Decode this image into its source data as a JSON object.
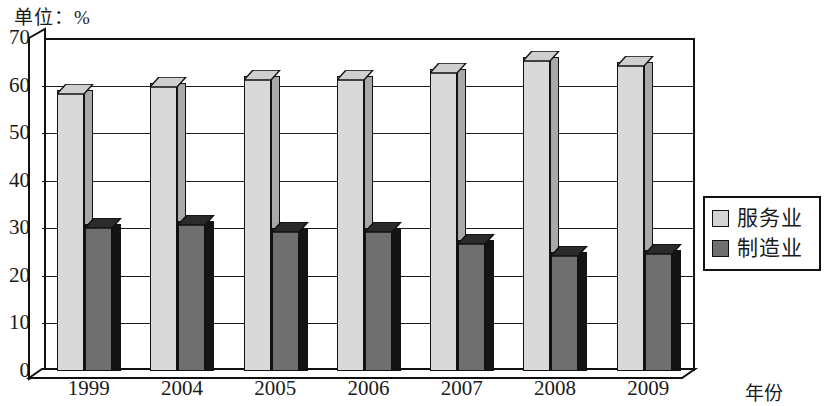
{
  "unit_label": "单位：%",
  "legend": {
    "items": [
      {
        "label": "服务业",
        "color": "#d4d4d4",
        "icon": "legend-swatch-light"
      },
      {
        "label": "制造业",
        "color": "#707070",
        "icon": "legend-swatch-dark"
      }
    ]
  },
  "axis": {
    "x_title": "年份",
    "y_ticks": [
      "0",
      "10",
      "20",
      "30",
      "40",
      "50",
      "60",
      "70"
    ]
  },
  "chart_data": {
    "type": "bar",
    "title": "",
    "subtitle": "",
    "xlabel": "年份",
    "ylabel": "单位：%",
    "categories": [
      "1999",
      "2004",
      "2005",
      "2006",
      "2007",
      "2008",
      "2009"
    ],
    "series": [
      {
        "name": "服务业",
        "color": "#d9d9d9",
        "values": [
          59,
          60.5,
          62,
          62,
          63.5,
          66,
          65
        ]
      },
      {
        "name": "制造业",
        "color": "#6f6f6f",
        "values": [
          31,
          31.5,
          30,
          30,
          27.5,
          25,
          25.5
        ]
      }
    ],
    "ylim": [
      0,
      70
    ],
    "ytick_step": 10,
    "grid": true,
    "legend_position": "right",
    "style": "3d-column"
  }
}
